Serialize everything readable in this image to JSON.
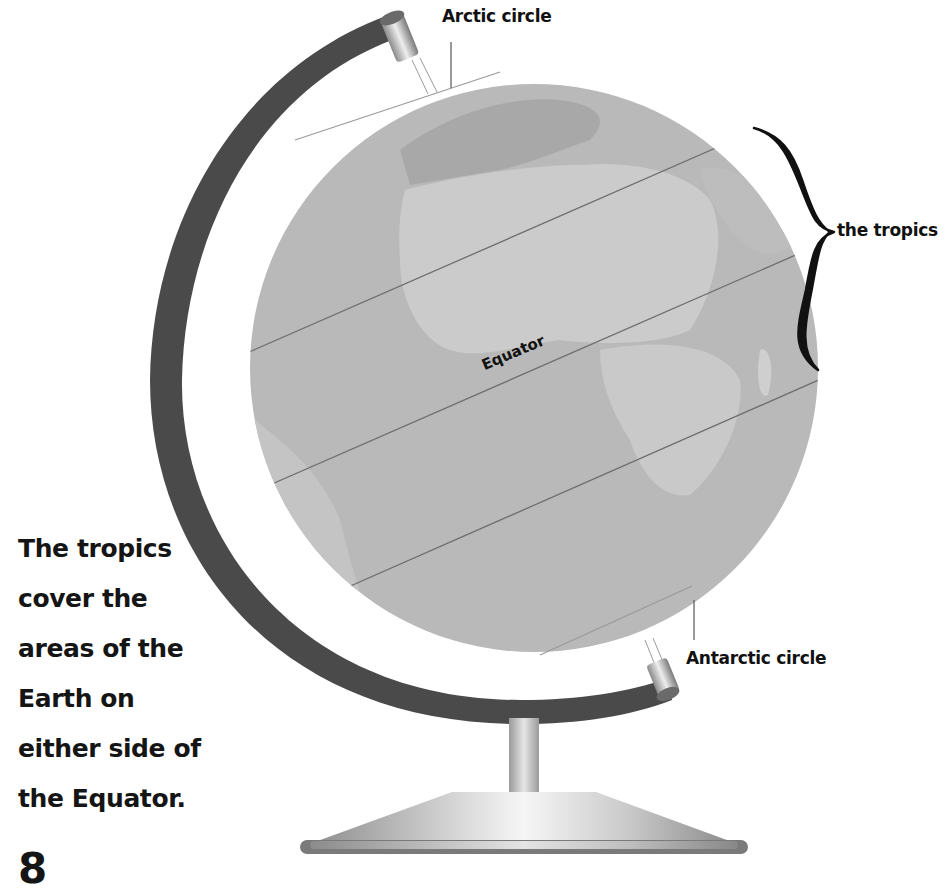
{
  "diagram": {
    "labels": {
      "arctic_circle": "Arctic circle",
      "antarctic_circle": "Antarctic circle",
      "equator": "Equator",
      "tropics": "the tropics"
    },
    "caption_lines": [
      "The tropics",
      "cover the",
      "areas of the",
      "Earth on",
      "either side of",
      "the Equator."
    ],
    "page_number": "8",
    "colors": {
      "ocean": "#b9b9b9",
      "land": "#cdcdcd",
      "land_dark": "#a9a9a9",
      "meridian_ring": "#4a4a4a",
      "lines": "#6e6e6e",
      "text": "#111111"
    },
    "icons": [
      "globe-illustration",
      "curly-brace-icon",
      "globe-stand-icon"
    ]
  }
}
